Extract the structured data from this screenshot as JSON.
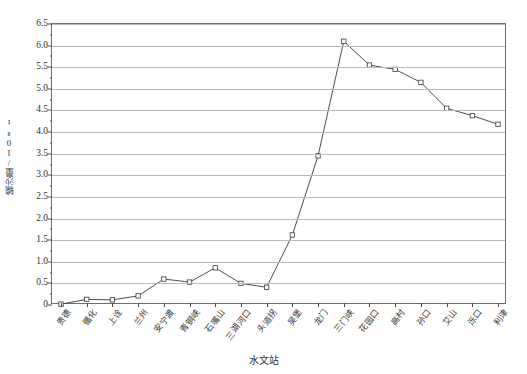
{
  "chart_data": {
    "type": "line",
    "title": "",
    "xlabel": "水文站",
    "ylabel": "输沙量",
    "ylabel_unit": "/10⁸t",
    "ylabel_full": "输沙量/10⁸t",
    "categories": [
      "贵德",
      "循化",
      "上诠",
      "兰州",
      "安宁渡",
      "青铜峡",
      "石嘴山",
      "三湖河口",
      "头道拐",
      "吴堡",
      "龙门",
      "三门峡",
      "花园口",
      "高村",
      "孙口",
      "艾山",
      "泺口",
      "利津"
    ],
    "values": [
      0.02,
      0.13,
      0.12,
      0.21,
      0.6,
      0.53,
      0.86,
      0.5,
      0.41,
      1.62,
      3.45,
      6.1,
      5.55,
      5.45,
      5.15,
      4.55,
      4.38,
      4.18
    ],
    "ylim": [
      0,
      6.5
    ],
    "ytick_step": 0.5,
    "yticks": [
      "0",
      "0.5",
      "1.0",
      "1.5",
      "2.0",
      "2.5",
      "3.0",
      "3.5",
      "4.0",
      "4.5",
      "5.0",
      "5.5",
      "6.0",
      "6.5"
    ],
    "grid": true,
    "legend": "none",
    "marker": "open-square",
    "line_color": "#3a3a3a",
    "grid_color": "#b9b9b9",
    "axis_color": "#6f6f6f",
    "marker_fill": "#ffffff"
  }
}
